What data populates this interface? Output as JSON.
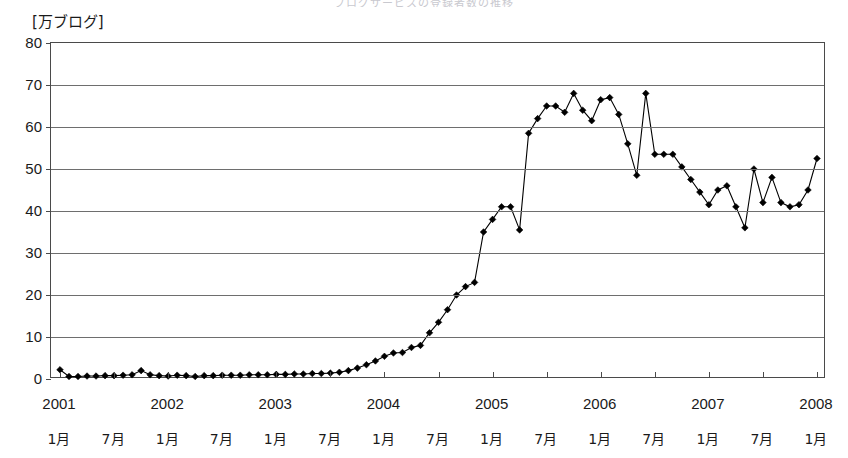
{
  "page": {
    "background_color": "#ffffff",
    "cut_off_title": "ブログサービスの登録者数の推移"
  },
  "axes": {
    "y_unit_label": "[万ブログ]",
    "y_ticks": [
      0,
      10,
      20,
      30,
      40,
      50,
      60,
      70,
      80
    ],
    "y_min": 0,
    "y_max": 80,
    "grid": true,
    "x_year_labels": [
      "2001",
      "2002",
      "2003",
      "2004",
      "2005",
      "2006",
      "2007",
      "2008"
    ],
    "x_month_labels": [
      "1月",
      "7月",
      "1月",
      "7月",
      "1月",
      "7月",
      "1月",
      "7月",
      "1月",
      "7月",
      "1月",
      "7月",
      "1月",
      "7月",
      "1月"
    ],
    "axis_color": "#4a4a4a",
    "grid_color": "#6e6e6e",
    "series_color": "#000000"
  },
  "chart_data": {
    "type": "line",
    "title": "",
    "xlabel": "",
    "ylabel": "万ブログ",
    "ylim": [
      0,
      80
    ],
    "grid": true,
    "legend": "none",
    "marker": "diamond",
    "x_start": "2001-01",
    "x_end": "2008-01",
    "x_interval": "monthly",
    "x": [
      "2001-01",
      "2001-02",
      "2001-03",
      "2001-04",
      "2001-05",
      "2001-06",
      "2001-07",
      "2001-08",
      "2001-09",
      "2001-10",
      "2001-11",
      "2001-12",
      "2002-01",
      "2002-02",
      "2002-03",
      "2002-04",
      "2002-05",
      "2002-06",
      "2002-07",
      "2002-08",
      "2002-09",
      "2002-10",
      "2002-11",
      "2002-12",
      "2003-01",
      "2003-02",
      "2003-03",
      "2003-04",
      "2003-05",
      "2003-06",
      "2003-07",
      "2003-08",
      "2003-09",
      "2003-10",
      "2003-11",
      "2003-12",
      "2004-01",
      "2004-02",
      "2004-03",
      "2004-04",
      "2004-05",
      "2004-06",
      "2004-07",
      "2004-08",
      "2004-09",
      "2004-10",
      "2004-11",
      "2004-12",
      "2005-01",
      "2005-02",
      "2005-03",
      "2005-04",
      "2005-05",
      "2005-06",
      "2005-07",
      "2005-08",
      "2005-09",
      "2005-10",
      "2005-11",
      "2005-12",
      "2006-01",
      "2006-02",
      "2006-03",
      "2006-04",
      "2006-05",
      "2006-06",
      "2006-07",
      "2006-08",
      "2006-09",
      "2006-10",
      "2006-11",
      "2006-12",
      "2007-01",
      "2007-02",
      "2007-03",
      "2007-04",
      "2007-05",
      "2007-06",
      "2007-07",
      "2007-08",
      "2007-09",
      "2007-10",
      "2007-11",
      "2007-12",
      "2008-01"
    ],
    "values": [
      2.2,
      0.6,
      0.6,
      0.7,
      0.7,
      0.8,
      0.8,
      0.9,
      1.0,
      2.0,
      1.0,
      0.8,
      0.7,
      0.9,
      0.8,
      0.6,
      0.8,
      0.8,
      0.9,
      0.9,
      0.9,
      1.0,
      1.0,
      1.0,
      1.1,
      1.1,
      1.2,
      1.2,
      1.3,
      1.3,
      1.4,
      1.6,
      2.0,
      2.6,
      3.4,
      4.3,
      5.4,
      6.2,
      6.3,
      7.5,
      8.0,
      11.0,
      13.5,
      16.5,
      20.0,
      22.0,
      23.0,
      35.0,
      38.0,
      41.0,
      41.0,
      35.5,
      58.5,
      62.0,
      65.0,
      65.0,
      63.5,
      68.0,
      64.0,
      61.5,
      66.5,
      67.0,
      63.0,
      56.0,
      48.5,
      68.0,
      53.5,
      53.5,
      53.5,
      50.5,
      47.5,
      44.5,
      41.5,
      45.0,
      46.0,
      41.0,
      36.0,
      50.0,
      42.0,
      48.0,
      42.0,
      41.0,
      41.5,
      45.0,
      52.5
    ],
    "notes": [
      {
        "label": "2004-12 jump",
        "value": 35.0
      },
      {
        "label": "2005-06 peak",
        "value": 68.0
      },
      {
        "label": "2006-06 spike",
        "value": 68.0
      },
      {
        "label": "2007-05 low",
        "value": 36.0
      },
      {
        "label": "2008-01 final",
        "value": 52.5
      }
    ]
  }
}
